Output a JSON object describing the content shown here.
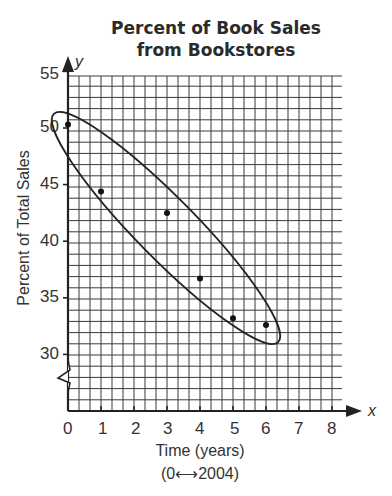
{
  "title_line1": "Percent of Book Sales",
  "title_line2": "from Bookstores",
  "x_axis_label": "Time (years)",
  "x_axis_sublabel": "(0⟷2004)",
  "x_axis_var": "x",
  "y_axis_label": "Percent of Total Sales",
  "y_axis_var": "y",
  "x_ticks": [
    "0",
    "1",
    "2",
    "3",
    "4",
    "5",
    "6",
    "7",
    "8"
  ],
  "y_ticks": [
    "55",
    "50",
    "45",
    "40",
    "35",
    "30"
  ],
  "chart_data": {
    "type": "scatter",
    "xlabel": "Time (years) (0 ↔ 2004)",
    "ylabel": "Percent of Total Sales",
    "x": [
      0,
      1,
      3,
      4,
      5,
      6
    ],
    "y": [
      50.3,
      44.4,
      42.5,
      36.7,
      33.2,
      32.6
    ],
    "xlim": [
      0,
      8.3
    ],
    "ylim": [
      25,
      55
    ],
    "x_ticks": [
      0,
      1,
      2,
      3,
      4,
      5,
      6,
      7,
      8
    ],
    "y_ticks": [
      30,
      35,
      40,
      45,
      50,
      55
    ],
    "grid": true,
    "axis_break": "y-axis between 0 and 30",
    "annotations": [
      "Ellipse enclosing all data points indicating negative linear trend"
    ]
  }
}
